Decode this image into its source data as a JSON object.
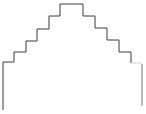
{
  "diagram": {
    "type": "stepped-outline",
    "stroke_color": "#3a3a3a",
    "right_leg_color": "#8a8a8a",
    "left_path": [
      [
        3,
        110
      ],
      [
        3,
        62
      ],
      [
        14,
        62
      ],
      [
        14,
        52
      ],
      [
        26,
        52
      ],
      [
        26,
        41
      ],
      [
        37,
        41
      ],
      [
        37,
        29
      ],
      [
        49,
        29
      ],
      [
        49,
        16
      ],
      [
        60,
        16
      ],
      [
        60,
        4
      ]
    ],
    "top_plateau": [
      [
        60,
        4
      ],
      [
        83,
        4
      ]
    ],
    "right_path": [
      [
        83,
        4
      ],
      [
        83,
        16
      ],
      [
        95,
        16
      ],
      [
        95,
        28
      ],
      [
        107,
        28
      ],
      [
        107,
        40
      ],
      [
        119,
        40
      ],
      [
        119,
        52
      ],
      [
        131,
        52
      ],
      [
        131,
        63
      ]
    ],
    "right_ledge": [
      [
        131,
        63
      ],
      [
        142,
        63
      ]
    ],
    "right_leg": [
      [
        142,
        64
      ],
      [
        142,
        106
      ]
    ]
  }
}
